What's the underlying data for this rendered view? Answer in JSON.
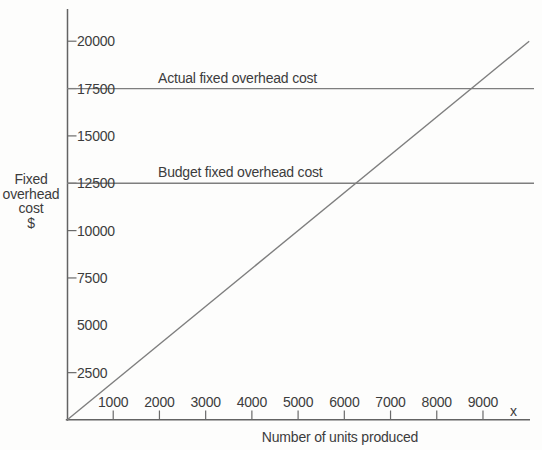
{
  "chart_data": {
    "type": "line",
    "title": "",
    "xlabel": "Number of units produced",
    "x_axis_symbol": "x",
    "ylabel_text": "Fixed overhead cost $",
    "ylabel_lines": [
      "Fixed",
      "overhead",
      "cost",
      "$"
    ],
    "x_ticks": [
      1000,
      2000,
      3000,
      4000,
      5000,
      6000,
      7000,
      8000,
      9000
    ],
    "y_ticks": [
      {
        "value": 2500,
        "dash": true
      },
      {
        "value": 5000,
        "dash": false
      },
      {
        "value": 7500,
        "dash": true
      },
      {
        "value": 10000,
        "dash": true
      },
      {
        "value": 12500,
        "dash": true
      },
      {
        "value": 15000,
        "dash": true
      },
      {
        "value": 17500,
        "dash": true
      },
      {
        "value": 20000,
        "dash": true
      }
    ],
    "x_range": [
      0,
      10000
    ],
    "y_range": [
      0,
      21000
    ],
    "grid": false,
    "legend_position": "inline-labels",
    "series": [
      {
        "name": "actual-fixed-overhead",
        "label": "Actual fixed overhead cost",
        "type": "hline",
        "value": 17500
      },
      {
        "name": "budget-fixed-overhead",
        "label": "Budget fixed overhead cost",
        "type": "hline",
        "value": 12500
      },
      {
        "name": "applied-fixed-overhead",
        "label": "",
        "type": "segment",
        "points": [
          [
            0,
            0
          ],
          [
            10000,
            20000
          ]
        ]
      }
    ],
    "colors": {
      "axis": "#636363",
      "series_line": "#7e7e7e",
      "tick": "#6a6a6a",
      "text": "#3c3c3c",
      "background": "#fdfdfc"
    }
  }
}
